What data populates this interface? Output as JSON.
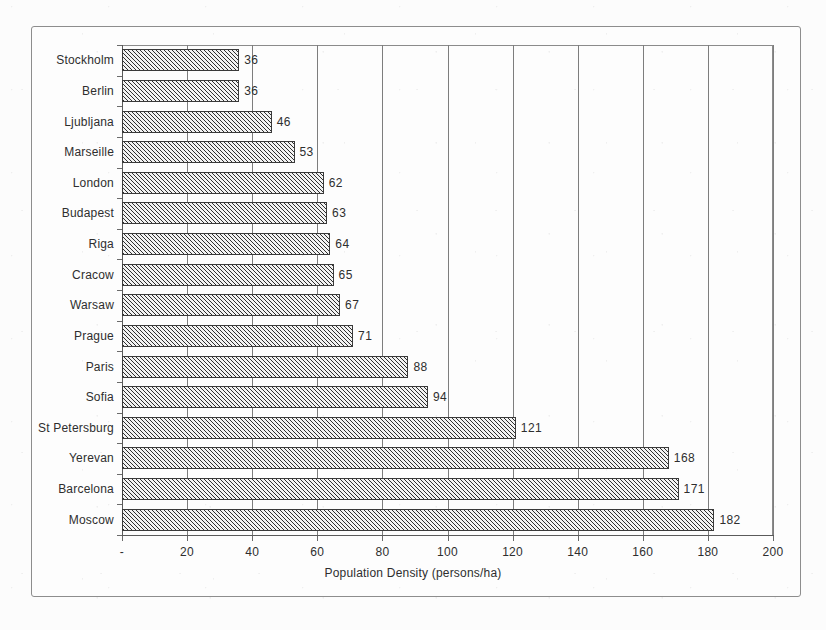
{
  "chart_data": {
    "type": "bar",
    "orientation": "horizontal",
    "title": "",
    "xlabel": "Population Density (persons/ha)",
    "ylabel": "",
    "xlim": [
      0,
      200
    ],
    "xticks": [
      "-",
      "20",
      "40",
      "60",
      "80",
      "100",
      "120",
      "140",
      "160",
      "180",
      "200"
    ],
    "xtick_values": [
      0,
      20,
      40,
      60,
      80,
      100,
      120,
      140,
      160,
      180,
      200
    ],
    "grid": "vertical",
    "legend": "none",
    "categories": [
      "Stockholm",
      "Berlin",
      "Ljubljana",
      "Marseille",
      "London",
      "Budapest",
      "Riga",
      "Cracow",
      "Warsaw",
      "Prague",
      "Paris",
      "Sofia",
      "St Petersburg",
      "Yerevan",
      "Barcelona",
      "Moscow"
    ],
    "values": [
      36,
      36,
      46,
      53,
      62,
      63,
      64,
      65,
      67,
      71,
      88,
      94,
      121,
      168,
      171,
      182
    ],
    "value_labels": [
      "36",
      "36",
      "46",
      "53",
      "62",
      "63",
      "64",
      "65",
      "67",
      "71",
      "88",
      "94",
      "121",
      "168",
      "171",
      "182"
    ],
    "bar_fill": "#a9a9a9",
    "bar_hatch": "diagonal",
    "bar_edge_color": "#3a3a3a",
    "gridline_color": "#7d7d7d",
    "axis_color": "#5a5a5a",
    "text_color": "#2e2e2e",
    "background": "#fdfdfd"
  },
  "axis_title": "Population Density (persons/ha)"
}
